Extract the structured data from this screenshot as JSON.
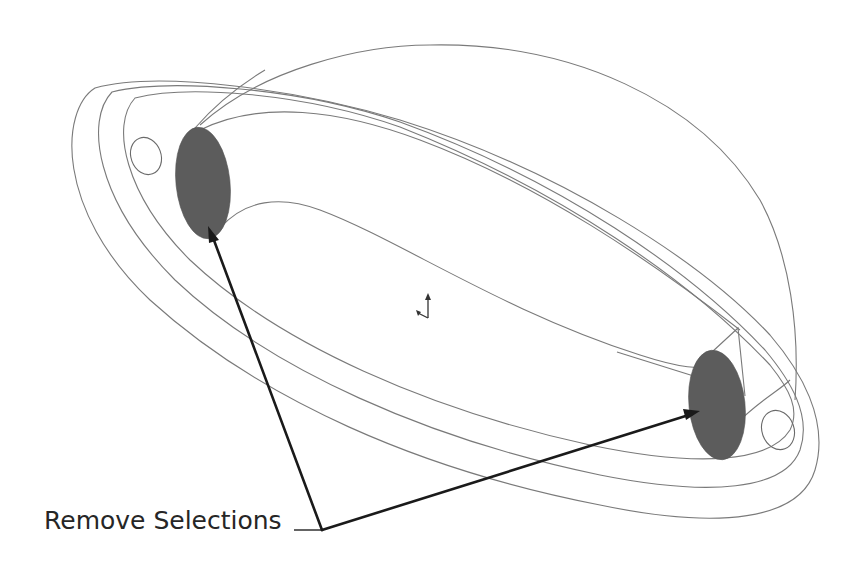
{
  "diagram": {
    "type": "cad-wireframe",
    "annotation": {
      "label": "Remove Selections",
      "targets": [
        "selected-face-left",
        "selected-face-right"
      ]
    },
    "colors": {
      "wireframe": "#7a7a7a",
      "selected_face": "#5c5c5c",
      "leader": "#1a1a1a",
      "text": "#262626",
      "background": "#ffffff"
    },
    "icons": {
      "origin_triad": "coordinate-triad-icon"
    }
  }
}
